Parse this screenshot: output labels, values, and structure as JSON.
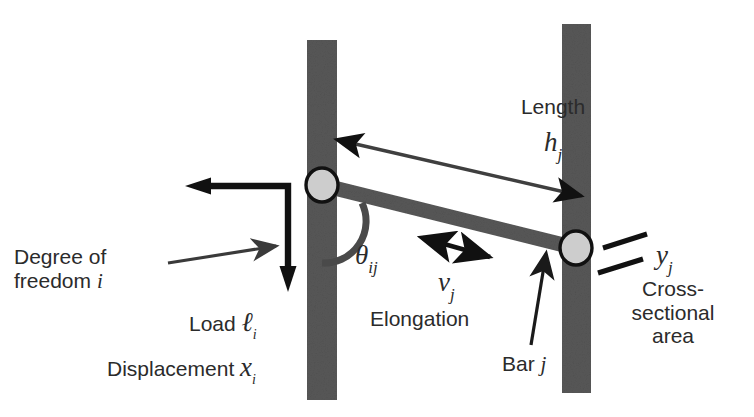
{
  "figure": {
    "background_color": "#ffffff",
    "structure_color": "#585858",
    "joint_fill_color": "#cdcdcd",
    "joint_stroke_color": "#111111",
    "text_color": "#2b2b2b",
    "arrow_color": "#111111",
    "thin_arrow_color": "#3a3a3a"
  },
  "labels": {
    "degree_of_freedom_line1": "Degree of",
    "degree_of_freedom_line2": "freedom",
    "degree_of_freedom_index": "i",
    "load_text": "Load",
    "load_symbol": "ℓ",
    "load_subscript": "i",
    "displacement_text": "Displacement",
    "displacement_symbol": "x",
    "displacement_subscript": "i",
    "theta_symbol": "θ",
    "theta_subscript": "ij",
    "elongation_text": "Elongation",
    "elongation_symbol": "v",
    "elongation_subscript": "j",
    "length_text": "Length",
    "length_symbol": "h",
    "length_subscript": "j",
    "bar_text": "Bar",
    "bar_index": "j",
    "area_symbol": "y",
    "area_subscript": "j",
    "cross_sectional_line1": "Cross-",
    "cross_sectional_line2": "sectional",
    "cross_sectional_line3": "area"
  },
  "geometry": {
    "left_column": {
      "x": 307,
      "y": 40,
      "width": 30,
      "height": 360
    },
    "right_column": {
      "x": 562,
      "y": 24,
      "width": 29,
      "height": 369
    },
    "diagonal_bar": {
      "x1": 322,
      "y1": 185,
      "x2": 576,
      "y2": 248,
      "thickness": 15
    },
    "left_joint": {
      "cx": 322,
      "cy": 185,
      "rx": 16,
      "ry": 17
    },
    "right_joint": {
      "cx": 576,
      "cy": 248,
      "rx": 16,
      "ry": 17
    },
    "length_arrow": {
      "x1": 338,
      "y1": 140,
      "x2": 582,
      "y2": 196
    },
    "elongation_arrow": {
      "x1": 421,
      "y1": 238,
      "x2": 492,
      "y2": 257
    },
    "load_arrow": {
      "corner_x": 288,
      "corner_y": 186,
      "left_end_x": 200,
      "bottom_end_y": 277
    },
    "dof_arrow": {
      "x1": 168,
      "y1": 262,
      "x2": 282,
      "y2": 245
    },
    "bar_arrow": {
      "x1": 531,
      "y1": 345,
      "x2": 546,
      "y2": 251
    },
    "area_dash_upper": {
      "x1": 603,
      "y1": 248,
      "x2": 647,
      "y2": 234
    },
    "area_dash_lower": {
      "x1": 598,
      "y1": 272,
      "x2": 643,
      "y2": 258
    }
  }
}
